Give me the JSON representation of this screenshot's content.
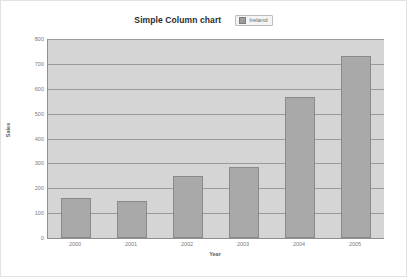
{
  "header": {
    "title": "Simple Column chart",
    "legend": {
      "label": "Ireland",
      "swatch_color": "#9d9d9d"
    }
  },
  "chart_data": {
    "type": "bar",
    "title": "Simple Column chart",
    "xlabel": "Year",
    "ylabel": "Sales",
    "categories": [
      "2000",
      "2001",
      "2002",
      "2003",
      "2004",
      "2005"
    ],
    "series": [
      {
        "name": "Ireland",
        "values": [
          160,
          150,
          250,
          285,
          565,
          730
        ],
        "color": "#a9a9a9"
      }
    ],
    "ylim": [
      0,
      800
    ],
    "ytick_step": 100,
    "yticks": [
      "0",
      "100",
      "200",
      "300",
      "400",
      "500",
      "600",
      "700",
      "800"
    ],
    "grid": true,
    "legend_position": "top-right-of-title",
    "plot_background": "#d5d5d5",
    "gridline_color": "#9a9a9a",
    "axis_color": "#8f8f8f"
  }
}
